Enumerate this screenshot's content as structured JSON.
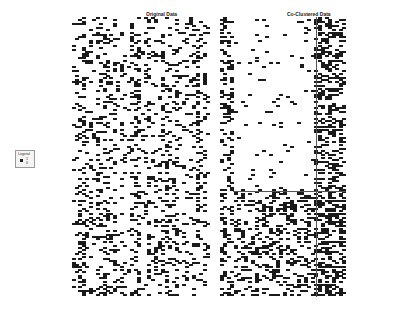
{
  "chart_data": {
    "type": "heatmap",
    "title": "",
    "subplots": [
      {
        "title": "Original Data",
        "rows": 130,
        "cols": 40,
        "description": "binary matrix, random order"
      },
      {
        "title": "Co-Clustered Data",
        "rows": 130,
        "cols": 36,
        "description": "binary matrix reordered into co-clusters",
        "row_split": 80,
        "col_split": 27
      }
    ],
    "legend": {
      "title": "Legend",
      "entries": [
        {
          "label": "1",
          "color": "#222222"
        },
        {
          "label": "0",
          "color": "#ffffff"
        }
      ]
    },
    "colors": {
      "on": "#1a1a1a",
      "off": "#ffffff"
    }
  },
  "titles": {
    "left": "Original Data",
    "right": "Co-Clustered Data"
  },
  "legend": {
    "title": "Legend",
    "one": "1",
    "zero": "0"
  }
}
